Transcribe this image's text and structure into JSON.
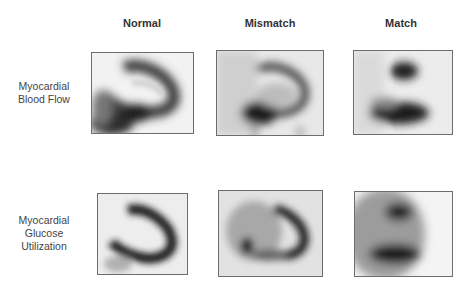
{
  "columns": [
    "Normal",
    "Mismatch",
    "Match"
  ],
  "rows": [
    {
      "label_line1": "Myocardial",
      "label_line2": "Blood Flow",
      "label_line3": ""
    },
    {
      "label_line1": "Myocardial",
      "label_line2": "Glucose",
      "label_line3": "Utilization"
    }
  ],
  "panels": [
    {
      "row": "Myocardial Blood Flow",
      "column": "Normal",
      "description": "perfusion scan with dense horseshoe-shaped uptake"
    },
    {
      "row": "Myocardial Blood Flow",
      "column": "Mismatch",
      "description": "perfusion scan with reduced septal/inferior uptake"
    },
    {
      "row": "Myocardial Blood Flow",
      "column": "Match",
      "description": "perfusion scan with two separated dark regions"
    },
    {
      "row": "Myocardial Glucose Utilization",
      "column": "Normal",
      "description": "FDG scan with dense horseshoe uptake"
    },
    {
      "row": "Myocardial Glucose Utilization",
      "column": "Mismatch",
      "description": "FDG scan with preserved curved uptake"
    },
    {
      "row": "Myocardial Glucose Utilization",
      "column": "Match",
      "description": "FDG scan with two separated dark regions"
    }
  ]
}
